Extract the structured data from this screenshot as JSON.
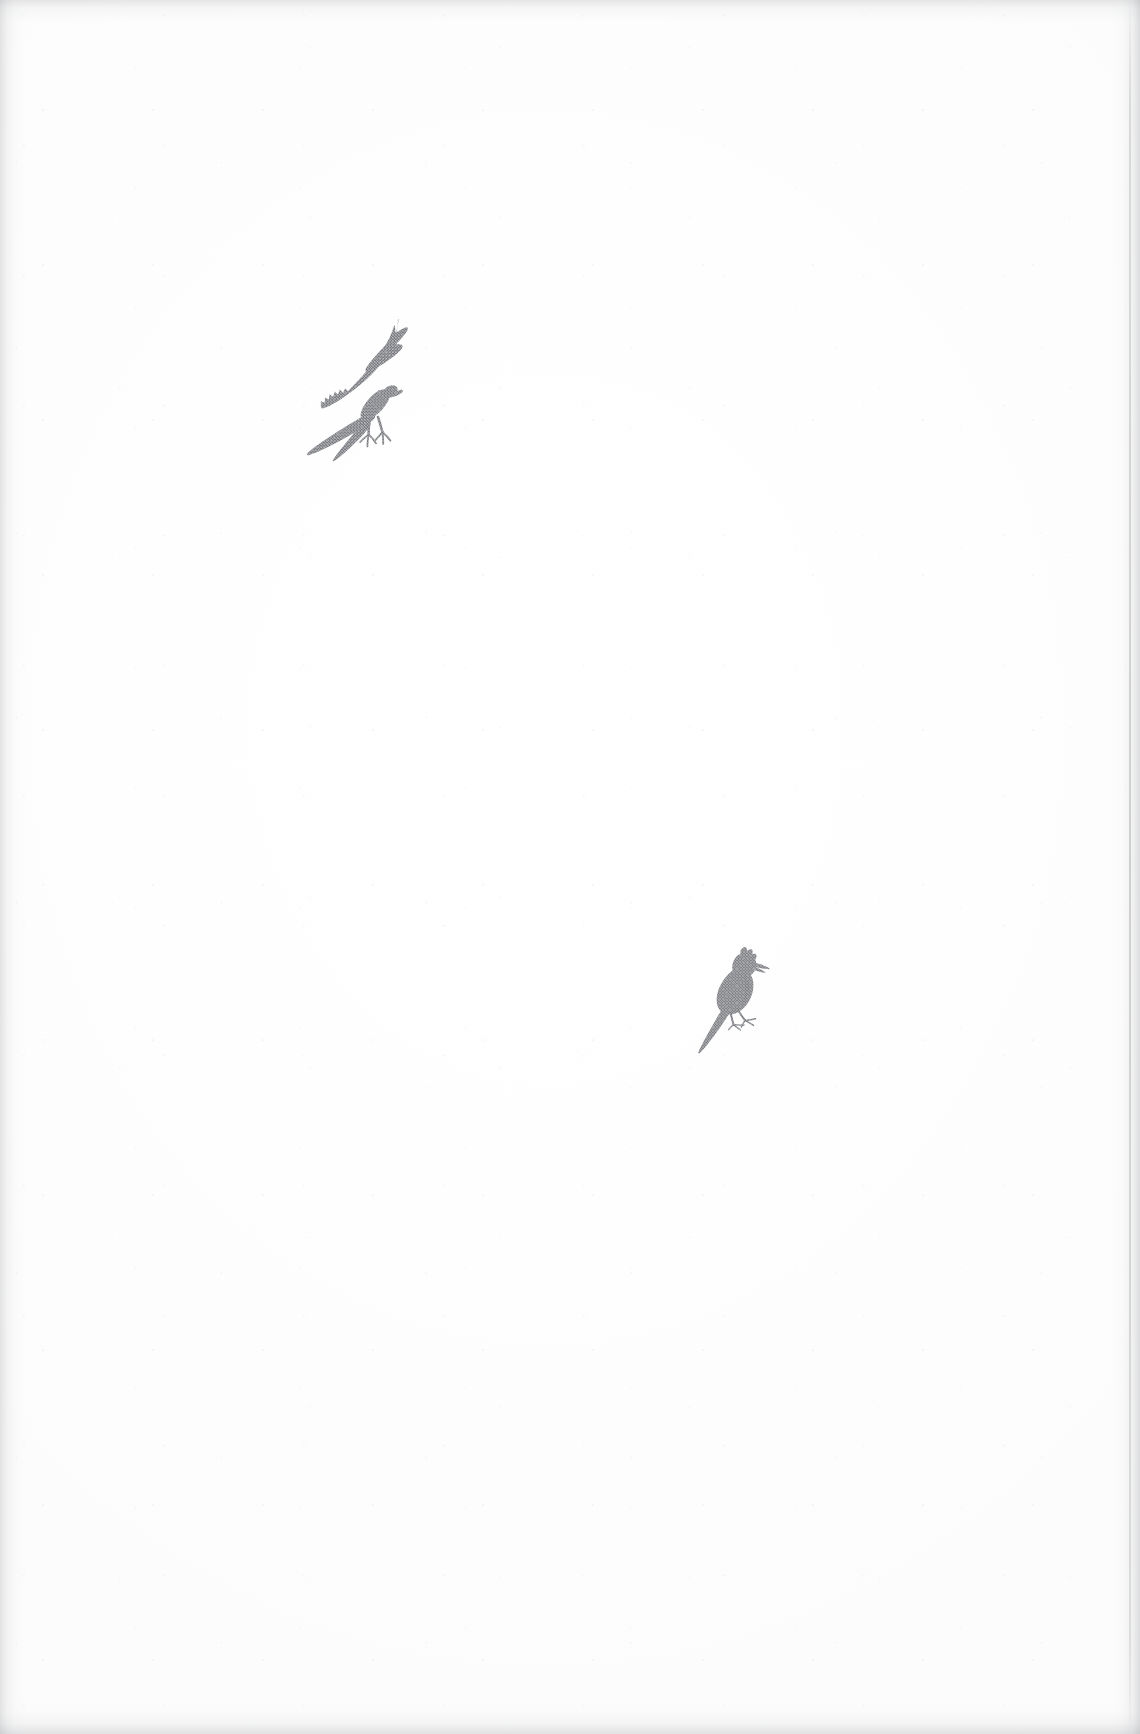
{
  "page": {
    "kind": "scanned-book-page",
    "orientation": "portrait",
    "width_px": 1140,
    "height_px": 1734,
    "background_color": "#fefefe",
    "paper_tone": "off-white scanned paper",
    "visible_text": "",
    "has_caption": false,
    "has_page_number": false,
    "edges": {
      "left_shadow": true,
      "right_shadow": true,
      "top_shadow": true,
      "bottom_shadow": true,
      "right_trim_line": true,
      "trim_line_color": "#96989c"
    }
  },
  "illustrations": [
    {
      "id": "flying-bird",
      "name": "Bird of prey in flight",
      "subject": "raptor (kestrel / hawk) with raised wings and extended talons",
      "pose": "ascending, wings swept upward, tail fanned down-left, legs lowered with open talons",
      "facing": "right",
      "style": "halftone silhouette, monochrome",
      "ink_color": "#808287",
      "position": {
        "left_px": 262,
        "top_px": 298,
        "width_px": 120,
        "height_px": 168
      },
      "center_px": {
        "x": 322,
        "y": 382
      }
    },
    {
      "id": "perched-bird",
      "name": "Small perched songbird",
      "subject": "crested songbird standing upright",
      "pose": "standing, head raised with short crest, beak pointing right, long tail angled down-left",
      "facing": "right",
      "style": "halftone silhouette, monochrome",
      "ink_color": "#7f8186",
      "position": {
        "left_px": 652,
        "top_px": 928,
        "width_px": 90,
        "height_px": 112
      },
      "center_px": {
        "x": 697,
        "y": 984
      }
    }
  ],
  "colors": {
    "paper": "#fefefe",
    "ink_gray": "#808287",
    "edge_shadow": "#96989c"
  }
}
